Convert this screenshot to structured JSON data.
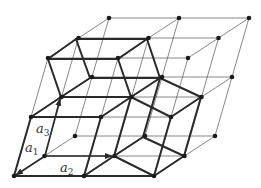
{
  "diagram": {
    "title": "",
    "colors": {
      "thin": "#555555",
      "thick": "#2a2a2a",
      "node": "#1a1a1a",
      "label": "#333333"
    },
    "lattice": {
      "origin": [
        14,
        176
      ],
      "a2": [
        70,
        0
      ],
      "back": [
        30.5,
        -20
      ],
      "a3": [
        17,
        -59
      ],
      "size": [
        3,
        3,
        3
      ]
    },
    "thick_edges": [
      [
        [
          76,
          39
        ],
        [
          147,
          39
        ]
      ],
      [
        [
          76,
          39
        ],
        [
          48,
          59
        ]
      ],
      [
        [
          76,
          39
        ],
        [
          90,
          78
        ]
      ],
      [
        [
          48,
          59
        ],
        [
          118,
          59
        ]
      ],
      [
        [
          48,
          59
        ],
        [
          61,
          97
        ]
      ],
      [
        [
          147,
          39
        ],
        [
          118,
          59
        ]
      ],
      [
        [
          147,
          39
        ],
        [
          160,
          78
        ]
      ],
      [
        [
          118,
          59
        ],
        [
          131,
          97
        ]
      ],
      [
        [
          90,
          78
        ],
        [
          160,
          78
        ]
      ],
      [
        [
          90,
          78
        ],
        [
          61,
          97
        ]
      ],
      [
        [
          160,
          78
        ],
        [
          131,
          97
        ]
      ],
      [
        [
          61,
          97
        ],
        [
          131,
          97
        ]
      ],
      [
        [
          61,
          97
        ],
        [
          31,
          117
        ]
      ],
      [
        [
          31,
          117
        ],
        [
          101,
          117
        ]
      ],
      [
        [
          31,
          117
        ],
        [
          14,
          176
        ]
      ],
      [
        [
          14,
          176
        ],
        [
          84,
          176
        ]
      ],
      [
        [
          101,
          117
        ],
        [
          84,
          176
        ]
      ],
      [
        [
          131,
          97
        ],
        [
          101,
          117
        ]
      ],
      [
        [
          131,
          97
        ],
        [
          171,
          117
        ]
      ],
      [
        [
          131,
          97
        ],
        [
          114,
          156
        ]
      ],
      [
        [
          160,
          78
        ],
        [
          201,
          97
        ]
      ],
      [
        [
          160,
          78
        ],
        [
          143,
          137
        ]
      ],
      [
        [
          201,
          97
        ],
        [
          171,
          117
        ]
      ],
      [
        [
          201,
          97
        ],
        [
          184,
          156
        ]
      ],
      [
        [
          171,
          117
        ],
        [
          154,
          176
        ]
      ],
      [
        [
          143,
          137
        ],
        [
          114,
          156
        ]
      ],
      [
        [
          143,
          137
        ],
        [
          184,
          156
        ]
      ],
      [
        [
          114,
          156
        ],
        [
          84,
          176
        ]
      ],
      [
        [
          114,
          156
        ],
        [
          154,
          176
        ]
      ],
      [
        [
          184,
          156
        ],
        [
          154,
          176
        ]
      ],
      [
        [
          84,
          176
        ],
        [
          154,
          176
        ]
      ]
    ],
    "vectors": [
      {
        "name": "a1",
        "from": [
          45,
          156
        ],
        "to": [
          16,
          175
        ],
        "label": "a",
        "sub": "1",
        "label_pos": [
          25,
          152
        ]
      },
      {
        "name": "a2",
        "from": [
          45,
          156
        ],
        "to": [
          112,
          156
        ],
        "label": "a",
        "sub": "2",
        "label_pos": [
          60,
          172
        ]
      },
      {
        "name": "a3",
        "from": [
          45,
          156
        ],
        "to": [
          60,
          99
        ],
        "label": "a",
        "sub": "3",
        "label_pos": [
          36,
          133
        ]
      }
    ]
  }
}
